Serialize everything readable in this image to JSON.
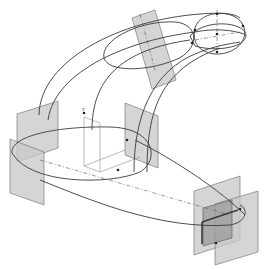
{
  "figure": {
    "background": "#ffffff",
    "colors": {
      "plane": "#c9c9c9",
      "plane_dark": "#9e9e9e",
      "curve": "#3a3a3a",
      "axis": "#555555"
    },
    "axis_label": "Z",
    "planes": [
      {
        "name": "top-tilted-plane",
        "points": "132,18 155,10 176,80 152,89"
      },
      {
        "name": "left-plane-back",
        "points": "17,114 58,101 58,148 17,162"
      },
      {
        "name": "left-plane-front",
        "points": "10,139 44,152 44,205 10,193"
      },
      {
        "name": "middle-plane",
        "points": "125,103 158,116 158,168 125,155"
      },
      {
        "name": "right-plane-back",
        "points": "194,191 240,176 240,240 194,255"
      },
      {
        "name": "right-plane-front",
        "points": "215,204 258,191 258,252 215,265"
      },
      {
        "name": "right-plane-inner",
        "points": "203,208 232,200 232,238 203,246"
      }
    ],
    "curves": [
      {
        "name": "top-outer-guide",
        "d": "M39,115 C40,60 120,20 200,14 C225,12 235,14 240,18"
      },
      {
        "name": "top-inner-guide",
        "d": "M48,120 C55,70 130,40 195,32 C215,28 232,30 244,34"
      },
      {
        "name": "mid-left-guide",
        "d": "M92,130 C92,80 120,50 190,40"
      },
      {
        "name": "mid-right-guide",
        "d": "M134,172 C134,120 150,70 200,52 C215,46 228,44 240,42"
      },
      {
        "name": "right-guide",
        "d": "M147,172 C147,110 160,70 220,48"
      },
      {
        "name": "upper-ellipse",
        "d": "M104,58 C100,40 140,20 175,22 C200,24 200,50 175,60 C145,72 108,72 104,58 Z"
      },
      {
        "name": "lower-ellipse",
        "d": "M12,153 C10,135 60,126 110,127 C155,128 160,160 140,172 C110,185 30,185 12,153 Z"
      },
      {
        "name": "right-profile-loop",
        "d": "M195,28 C200,10 235,8 243,25 C250,40 235,55 215,54 C198,52 192,42 195,28 Z"
      },
      {
        "name": "right-profile-loop-2",
        "d": "M190,36 C205,18 245,22 246,35 C246,48 215,52 195,46 Z"
      },
      {
        "name": "swoop-to-right",
        "d": "M135,140 C175,160 220,190 245,215"
      },
      {
        "name": "swoop-bottom",
        "d": "M40,180 C90,200 160,230 230,225 C248,222 248,208 240,205"
      }
    ],
    "dash_lines": [
      {
        "name": "top-axis",
        "d": "M140,14 L155,70"
      },
      {
        "name": "upper-axis",
        "d": "M195,40 L240,32"
      },
      {
        "name": "lower-axis",
        "d": "M40,160 L230,215"
      },
      {
        "name": "vertical-axis",
        "d": "M217,10 L217,55"
      }
    ],
    "points": [
      {
        "x": 217,
        "y": 14
      },
      {
        "x": 217,
        "y": 34
      },
      {
        "x": 217,
        "y": 52
      },
      {
        "x": 243,
        "y": 26
      },
      {
        "x": 195,
        "y": 30
      },
      {
        "x": 192,
        "y": 43
      },
      {
        "x": 84,
        "y": 113
      },
      {
        "x": 127,
        "y": 140
      },
      {
        "x": 118,
        "y": 170
      },
      {
        "x": 240,
        "y": 209
      },
      {
        "x": 216,
        "y": 243
      }
    ]
  }
}
